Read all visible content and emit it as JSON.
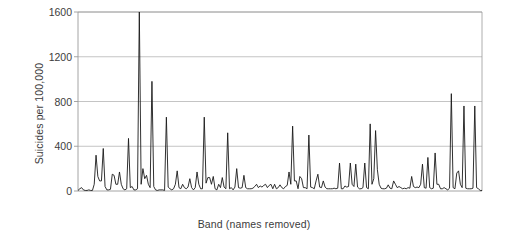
{
  "chart_data": {
    "type": "line",
    "title": "",
    "xlabel": "Band (names removed)",
    "ylabel": "Suicides per 100,000",
    "ylim": [
      0,
      1600
    ],
    "yticks": [
      0,
      400,
      800,
      1200,
      1600
    ],
    "ytick_labels": [
      "0",
      "400",
      "800",
      "1200",
      "1600"
    ],
    "xticks": [],
    "xtick_labels": [],
    "grid": "horizontal",
    "legend": "none",
    "series_color": "#1a1a1a",
    "axis_color": "#9a9a9a",
    "grid_color": "#b5b5b5",
    "background": "#ffffff",
    "series": [
      {
        "name": "Suicides per 100,000",
        "values": [
          5,
          20,
          30,
          10,
          5,
          5,
          10,
          5,
          5,
          60,
          320,
          130,
          90,
          90,
          380,
          40,
          10,
          10,
          15,
          150,
          140,
          60,
          60,
          170,
          60,
          20,
          10,
          20,
          470,
          30,
          40,
          10,
          10,
          20,
          1600,
          60,
          200,
          110,
          140,
          60,
          30,
          980,
          40,
          10,
          5,
          10,
          10,
          10,
          5,
          660,
          35,
          20,
          10,
          20,
          60,
          180,
          30,
          20,
          60,
          30,
          20,
          35,
          110,
          30,
          10,
          30,
          170,
          60,
          20,
          20,
          660,
          70,
          120,
          120,
          60,
          130,
          20,
          10,
          60,
          30,
          120,
          35,
          20,
          520,
          20,
          30,
          10,
          35,
          200,
          30,
          25,
          30,
          140,
          30,
          20,
          20,
          20,
          25,
          40,
          60,
          30,
          45,
          35,
          50,
          60,
          30,
          50,
          60,
          20,
          60,
          20,
          30,
          55,
          30,
          20,
          40,
          50,
          170,
          60,
          580,
          90,
          90,
          20,
          130,
          110,
          30,
          30,
          20,
          500,
          35,
          30,
          20,
          90,
          150,
          35,
          30,
          90,
          35,
          20,
          20,
          20,
          20,
          25,
          20,
          25,
          250,
          20,
          20,
          45,
          35,
          40,
          250,
          60,
          40,
          240,
          35,
          20,
          20,
          30,
          250,
          30,
          20,
          600,
          60,
          110,
          540,
          190,
          60,
          25,
          20,
          20,
          25,
          55,
          25,
          20,
          90,
          60,
          30,
          40,
          30,
          20,
          25,
          20,
          30,
          25,
          130,
          40,
          30,
          35,
          30,
          60,
          240,
          30,
          25,
          300,
          30,
          20,
          25,
          340,
          60,
          60,
          20,
          20,
          30,
          20,
          10,
          25,
          870,
          30,
          20,
          160,
          180,
          60,
          30,
          760,
          25,
          20,
          20,
          20,
          25,
          760,
          30,
          20,
          5,
          5
        ]
      }
    ]
  }
}
